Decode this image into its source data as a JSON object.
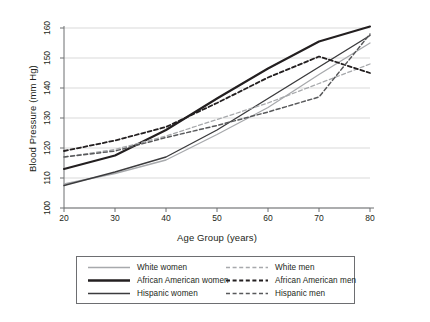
{
  "chart_data": {
    "type": "line",
    "title": "",
    "xlabel": "Age Group (years)",
    "ylabel": "Blood Pressure (mm Hg)",
    "xlim": [
      20,
      80
    ],
    "ylim": [
      100,
      160
    ],
    "xticks": [
      20,
      30,
      40,
      50,
      60,
      70,
      80
    ],
    "yticks": [
      100,
      110,
      120,
      130,
      140,
      150,
      160
    ],
    "grid": "horizontal",
    "legend_position": "bottom",
    "x": [
      20,
      30,
      40,
      50,
      60,
      70,
      80
    ],
    "series": [
      {
        "name": "White women",
        "style": "solid",
        "color": "#a7a9ac",
        "width": 1.3,
        "values": [
          108,
          111.5,
          116,
          124.5,
          133.5,
          144.5,
          155
        ]
      },
      {
        "name": "African American women",
        "style": "solid",
        "color": "#231f20",
        "width": 2.1,
        "values": [
          113,
          117.5,
          126,
          136.5,
          146.5,
          155.5,
          160.5
        ]
      },
      {
        "name": "Hispanic women",
        "style": "solid",
        "color": "#3b3b3d",
        "width": 1.4,
        "values": [
          107.5,
          112,
          117,
          126,
          136.5,
          147,
          157.5
        ]
      },
      {
        "name": "White men",
        "style": "dashed",
        "color": "#a7a9ac",
        "width": 1.3,
        "values": [
          117,
          119.5,
          124,
          129.5,
          135,
          141.5,
          148
        ]
      },
      {
        "name": "African American men",
        "style": "dashed",
        "color": "#231f20",
        "width": 1.8,
        "values": [
          119,
          122.5,
          127,
          135,
          143.5,
          150.5,
          145
        ]
      },
      {
        "name": "Hispanic men",
        "style": "dashed",
        "color": "#58595b",
        "width": 1.5,
        "values": [
          117,
          119,
          123.5,
          127.5,
          132,
          137,
          158
        ]
      }
    ]
  },
  "axis": {
    "ylabel": "Blood Pressure (mm Hg)",
    "xlabel": "Age Group (years)",
    "yticks": [
      "100",
      "110",
      "120",
      "130",
      "140",
      "150",
      "160"
    ],
    "xticks": [
      "20",
      "30",
      "40",
      "50",
      "60",
      "70",
      "80"
    ]
  },
  "legend": {
    "left_column": [
      {
        "label": "White women",
        "style": "solid",
        "color": "#a7a9ac",
        "width": 1.4
      },
      {
        "label": "African American women",
        "style": "solid",
        "color": "#231f20",
        "width": 2.4
      },
      {
        "label": "Hispanic women",
        "style": "solid",
        "color": "#3b3b3d",
        "width": 1.5
      }
    ],
    "right_column": [
      {
        "label": "White men",
        "style": "dashed",
        "color": "#a7a9ac",
        "width": 1.4
      },
      {
        "label": "African American men",
        "style": "dashed",
        "color": "#231f20",
        "width": 2.0
      },
      {
        "label": "Hispanic men",
        "style": "dashed",
        "color": "#58595b",
        "width": 1.6
      }
    ]
  },
  "colors": {
    "grid": "#d9d9d9",
    "axis": "#6d6e71",
    "text": "#231f20",
    "background": "#ffffff"
  }
}
